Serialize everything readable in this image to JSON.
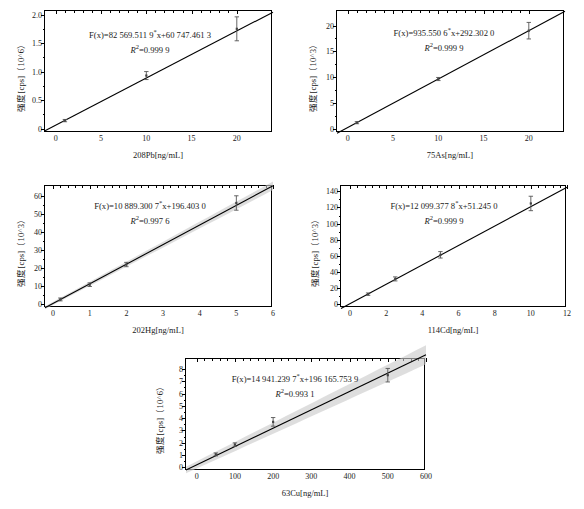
{
  "figure": {
    "panel_count": 5,
    "axis_common": {
      "ylabel_prefix": "强度[cps]",
      "x_unit": "ng/mL"
    }
  },
  "chart_data": [
    {
      "id": "pb208",
      "type": "scatter",
      "title": "",
      "xlabel": "208Pb[ng/mL]",
      "ylabel": "强度[cps]（10^6）",
      "ylabel_unit": "（10^6）",
      "equation": "F(x)=82 569.511 9*x+60 747.461 3",
      "eq_coef": "82 569.511 9",
      "eq_intercept": "60 747.461 3",
      "r2_label": "R²=0.999 9",
      "r2": 0.9999,
      "slope": 82569.5119,
      "intercept": 60747.4613,
      "xlim": [
        -1.2,
        24
      ],
      "ylim": [
        -0.06,
        2.08
      ],
      "xticks": [
        0,
        5,
        10,
        15,
        20
      ],
      "yticks": [
        0,
        0.5,
        1.0,
        1.5,
        2.0
      ],
      "ytick_labels": [
        "0",
        "0.5",
        "1.0",
        "1.5",
        "2.0"
      ],
      "x": [
        1,
        10,
        20
      ],
      "y": [
        0.14,
        0.93,
        1.75
      ],
      "yerr": [
        0.02,
        0.07,
        0.21
      ],
      "band": false
    },
    {
      "id": "as75",
      "type": "scatter",
      "title": "",
      "xlabel": "75As[ng/mL]",
      "ylabel": "强度[cps]（10^3）",
      "ylabel_unit": "（10^3）",
      "equation": "F(x)=935.550 6*x+292.302 0",
      "eq_coef": "935.550 6",
      "eq_intercept": "292.302 0",
      "r2_label": "R²=0.999 9",
      "r2": 0.9999,
      "slope": 935.5506,
      "intercept": 292.302,
      "xlim": [
        -1.2,
        24
      ],
      "ylim": [
        -0.6,
        23
      ],
      "xticks": [
        0,
        5,
        10,
        15,
        20
      ],
      "yticks": [
        0,
        5,
        10,
        15,
        20
      ],
      "ytick_labels": [
        "0",
        "5",
        "10",
        "15",
        "20"
      ],
      "x": [
        1,
        10,
        20
      ],
      "y": [
        1.2,
        9.65,
        19.0
      ],
      "yerr": [
        0.2,
        0.3,
        1.6
      ],
      "band": false
    },
    {
      "id": "hg202",
      "type": "scatter",
      "title": "",
      "xlabel": "202Hg[ng/mL]",
      "ylabel": "强度[cps]（10^3）",
      "ylabel_unit": "（10^3）",
      "equation": "F(x)=10 889.300 7*x+196.403 0",
      "eq_coef": "10 889.300 7",
      "eq_intercept": "196.403 0",
      "r2_label": "R²=0.997 6",
      "r2": 0.9976,
      "slope": 10889.3007,
      "intercept": 196.403,
      "xlim": [
        -0.22,
        6.0
      ],
      "ylim": [
        -1.8,
        66
      ],
      "xticks": [
        0,
        1,
        2,
        3,
        4,
        5,
        6
      ],
      "yticks": [
        0,
        10,
        20,
        30,
        40,
        50,
        60
      ],
      "ytick_labels": [
        "0",
        "10",
        "20",
        "30",
        "40",
        "50",
        "60"
      ],
      "x": [
        0.2,
        1,
        2,
        5
      ],
      "y": [
        2.4,
        10.6,
        21.8,
        56.0
      ],
      "yerr": [
        0.8,
        1.0,
        1.2,
        4.0
      ],
      "band": true,
      "band_halfwidth_frac": 0.035
    },
    {
      "id": "cd114",
      "type": "scatter",
      "title": "",
      "xlabel": "114Cd[ng/mL]",
      "ylabel": "强度[cps]（10^3）",
      "ylabel_unit": "（10^3）",
      "equation": "F(x)=12 099.377 8*x+51.245 0",
      "eq_coef": "12 099.377 8",
      "eq_intercept": "51.245 0",
      "r2_label": "R²=0.999 9",
      "r2": 0.9999,
      "slope": 12099.3778,
      "intercept": 51.245,
      "xlim": [
        -0.5,
        12
      ],
      "ylim": [
        -4,
        148
      ],
      "xticks": [
        0,
        2,
        4,
        6,
        8,
        10,
        12
      ],
      "yticks": [
        0,
        20,
        40,
        60,
        80,
        100,
        120,
        140
      ],
      "ytick_labels": [
        "0",
        "20",
        "40",
        "60",
        "80",
        "100",
        "120",
        "140"
      ],
      "x": [
        1,
        2.5,
        5,
        10
      ],
      "y": [
        12.0,
        31.0,
        61.0,
        125.0
      ],
      "yerr": [
        1.5,
        2.5,
        4.0,
        9.0
      ],
      "band": false
    },
    {
      "id": "cu63",
      "type": "scatter",
      "title": "",
      "xlabel": "63Cu[ng/mL]",
      "ylabel": "强度[cps]（10^6）",
      "ylabel_unit": "（10^6）",
      "equation": "F(x)=14 941.239 7*x+196 165.753 9",
      "eq_coef": "14 941.239 7",
      "eq_intercept": "196 165.753 9",
      "r2_label": "R²=0.993 1",
      "r2": 0.9931,
      "slope": 14941.2397,
      "intercept": 196165.7539,
      "xlim": [
        -28,
        600
      ],
      "ylim": [
        -0.22,
        8.9
      ],
      "xticks": [
        0,
        100,
        200,
        300,
        400,
        500,
        600
      ],
      "yticks": [
        0,
        1,
        2,
        3,
        4,
        5,
        6,
        7,
        8
      ],
      "ytick_labels": [
        "0",
        "1",
        "2",
        "3",
        "4",
        "5",
        "6",
        "7",
        "8"
      ],
      "x": [
        50,
        100,
        200,
        500
      ],
      "y": [
        1.05,
        1.85,
        3.7,
        7.5
      ],
      "yerr": [
        0.12,
        0.14,
        0.35,
        0.55
      ],
      "band": true,
      "band_halfwidth_frac": 0.085
    }
  ]
}
